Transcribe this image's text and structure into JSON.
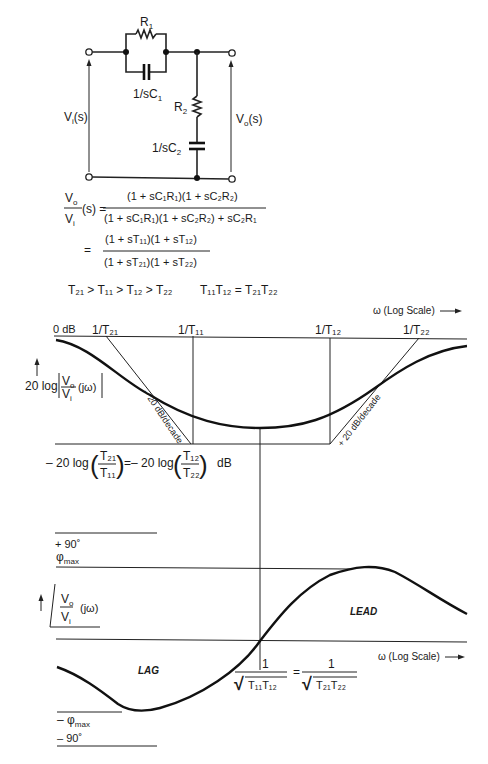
{
  "circuit": {
    "r1": "R",
    "r1_sub": "1",
    "c1": "1/sC",
    "c1_sub": "1",
    "r2": "R",
    "r2_sub": "2",
    "c2": "1/sC",
    "c2_sub": "2",
    "vin": "V",
    "vin_sub": "i",
    "vin_tail": "(s)",
    "vout": "V",
    "vout_sub": "o",
    "vout_tail": "(s)"
  },
  "equations": {
    "lhs_num": "V",
    "lhs_num_sub": "o",
    "lhs_tail": "(s) =",
    "lhs_den": "V",
    "lhs_den_sub": "i",
    "eq1_num": "(1 + sC₁R₁)(1 + sC₂R₂)",
    "eq1_den": "(1 + sC₁R₁)(1 + sC₂R₂) + sC₂R₁",
    "eq2_eq": "=",
    "eq2_num": "(1 + sT₁₁)(1 + sT₁₂)",
    "eq2_den": "(1 + sT₂₁)(1 + sT₂₂)",
    "inequality": "T₂₁ > T₁₁ > T₁₂ > T₂₂",
    "product": "T₁₁T₁₂ = T₂₁T₂₂"
  },
  "magnitude_plot": {
    "axis_label": "ω (Log Scale)",
    "zero_db": "0 dB",
    "breakpoints": [
      "1/T₂₁",
      "1/T₁₁",
      "1/T₁₂",
      "1/T₂₂"
    ],
    "ylabel_prefix": "20 log",
    "ylabel_frac_num": "V",
    "ylabel_frac_num_sub": "o",
    "ylabel_frac_den": "V",
    "ylabel_frac_den_sub": "i",
    "ylabel_tail": "(jω)",
    "slope_left": "– 20 dB/decade",
    "slope_right": "+ 20 dB/decade",
    "floor_prefix": "– 20 log",
    "floor_t21": "T₂₁",
    "floor_t11": "T₁₁",
    "floor_mid": "=– 20 log",
    "floor_t12": "T₁₂",
    "floor_t22": "T₂₂",
    "floor_unit": "dB"
  },
  "phase_plot": {
    "plus90": "+ 90˚",
    "phi_max": "φ",
    "phi_max_sub": "max",
    "ylabel_num": "V",
    "ylabel_num_sub": "o",
    "ylabel_den": "V",
    "ylabel_den_sub": "i",
    "ylabel_tail": "(jω)",
    "lead": "LEAD",
    "lag": "LAG",
    "axis_label": "ω (Log Scale)",
    "center_num": "1",
    "center_den_left": "T₁₁T₁₂",
    "center_eq": "=",
    "center_den_right": "T₂₁T₂₂",
    "minus_phi_max": "– φ",
    "minus_phi_max_sub": "max",
    "minus90": "– 90˚"
  },
  "arrow_glyph": "—▸"
}
